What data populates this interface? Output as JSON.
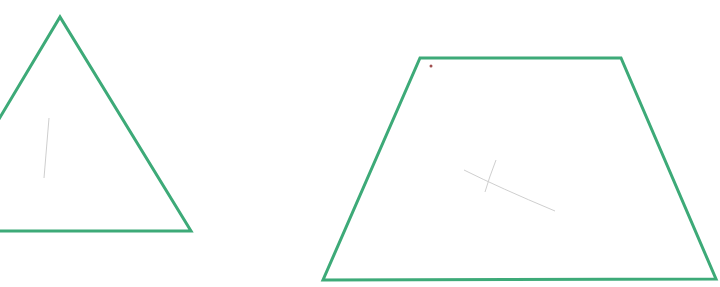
{
  "canvas": {
    "width": 720,
    "height": 287,
    "background": "#ffffff"
  },
  "stroke_color": "#3daa78",
  "stroke_width": 3,
  "shapes": [
    {
      "name": "triangle",
      "points": "-4,124 60,17 191,231 -4,231"
    },
    {
      "name": "trapezoid",
      "points": "420,58 621,58 716,279 323,280"
    }
  ],
  "marks": {
    "dot": {
      "x": 431,
      "y": 66,
      "color": "#a05050"
    },
    "pencil_strokes": [
      "M464,170 Q500,188 555,211",
      "M496,160 Q489,178 485,192",
      "M49,118 L44,178"
    ]
  }
}
